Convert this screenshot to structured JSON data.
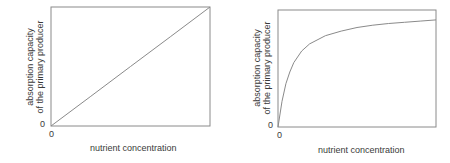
{
  "chart_data": [
    {
      "type": "line",
      "title": "",
      "xlabel": "nutrient concentration",
      "ylabel": "absorption capacity of the primary producer",
      "ylabel_lines": [
        "absorption capacity",
        "of the primary producer"
      ],
      "x_tick_labels": [
        "0"
      ],
      "y_tick_labels": [
        "0"
      ],
      "grid": false,
      "legend": null,
      "shape": "linear",
      "x": [
        0,
        0.25,
        0.5,
        0.75,
        1.0
      ],
      "y": [
        0,
        0.25,
        0.5,
        0.75,
        1.0
      ],
      "xlim": [
        0,
        1
      ],
      "ylim": [
        0,
        1
      ]
    },
    {
      "type": "line",
      "title": "",
      "xlabel": "nutrient concentration",
      "ylabel": "absorption capacity of the primary producer",
      "ylabel_lines": [
        "absorption capacity",
        "of the primary producer"
      ],
      "x_tick_labels": [
        "0"
      ],
      "y_tick_labels": [
        "0"
      ],
      "grid": false,
      "legend": null,
      "shape": "saturating (Michaelis-Menten-like)",
      "x": [
        0,
        0.025,
        0.05,
        0.075,
        0.1,
        0.15,
        0.2,
        0.3,
        0.4,
        0.5,
        0.6,
        0.7,
        0.8,
        0.9,
        1.0
      ],
      "y": [
        0,
        0.22,
        0.37,
        0.47,
        0.55,
        0.65,
        0.71,
        0.78,
        0.82,
        0.85,
        0.87,
        0.885,
        0.895,
        0.905,
        0.915
      ],
      "xlim": [
        0,
        1
      ],
      "ylim": [
        0,
        1
      ]
    }
  ],
  "charts": [
    {
      "ylabel_line1": "absorption capacity",
      "ylabel_line2": "of the primary producer",
      "xlabel": "nutrient concentration",
      "x_zero": "0",
      "y_zero": "0"
    },
    {
      "ylabel_line1": "absorption capacity",
      "ylabel_line2": "of the primary producer",
      "xlabel": "nutrient concentration",
      "x_zero": "0",
      "y_zero": "0"
    }
  ],
  "colors": {
    "axis": "#8a8a8a",
    "line": "#8a8a8a",
    "text": "#3a3a3a"
  }
}
